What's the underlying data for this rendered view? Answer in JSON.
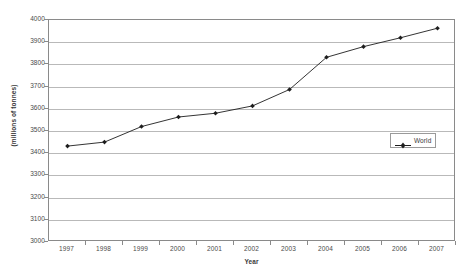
{
  "chart_data": {
    "type": "line",
    "title": "",
    "xlabel": "Year",
    "ylabel": "(millions of tonnes)",
    "categories": [
      "1997",
      "1998",
      "1999",
      "2000",
      "2001",
      "2002",
      "2003",
      "2004",
      "2005",
      "2006",
      "2007"
    ],
    "series": [
      {
        "name": "World",
        "values": [
          3432,
          3450,
          3520,
          3563,
          3580,
          3613,
          3687,
          3832,
          3880,
          3920,
          3963
        ],
        "color": "#1d1d1d",
        "marker": "diamond"
      }
    ],
    "ylim": [
      3000,
      4000
    ],
    "yticks": [
      3000,
      3100,
      3200,
      3300,
      3400,
      3500,
      3600,
      3700,
      3800,
      3900,
      4000
    ],
    "ytick_labels": [
      "3000",
      "3100",
      "3200",
      "3300",
      "3400",
      "3500",
      "3600",
      "3700",
      "3800",
      "3900",
      "4000"
    ],
    "xtick_labels": [
      "1997",
      "1998",
      "1999",
      "2000",
      "2001",
      "2002",
      "2003",
      "2004",
      "2005",
      "2006",
      "2007"
    ],
    "grid": "horizontal",
    "legend_position": "right-middle",
    "legend_entries": [
      "World"
    ],
    "plot_border_color": "#8a8a8a",
    "gridline_color": "#b9b9b9",
    "background_color": "#ffffff"
  },
  "legend": {
    "entry_label": "World"
  },
  "axes": {
    "x_title": "Year",
    "y_title": "(millions of tonnes)"
  }
}
